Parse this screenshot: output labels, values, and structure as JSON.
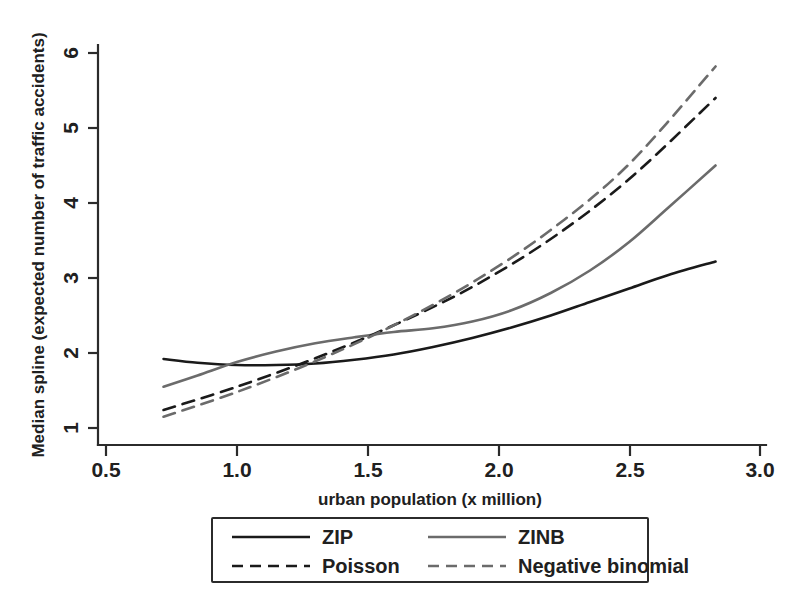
{
  "chart_data": {
    "type": "line",
    "title": "",
    "xlabel": "urban population (x million)",
    "ylabel": "Median spline (expected number of traffic accidents)",
    "xlim": [
      0.36,
      3.06
    ],
    "ylim": [
      0.75,
      6.1
    ],
    "xticks": [
      0.5,
      1.0,
      1.5,
      2.0,
      2.5,
      3.0
    ],
    "xtick_labels": [
      "0.5",
      "1.0",
      "1.5",
      "2.0",
      "2.5",
      "3.0"
    ],
    "yticks": [
      1,
      2,
      3,
      4,
      5,
      6
    ],
    "ytick_labels": [
      "1",
      "2",
      "3",
      "4",
      "5",
      "6"
    ],
    "grid": false,
    "legend_position": "below-center",
    "series": [
      {
        "name": "ZIP",
        "style": "solid",
        "color": "#1a1a1a",
        "x": [
          0.72,
          0.85,
          1.0,
          1.15,
          1.3,
          1.45,
          1.6,
          1.75,
          1.9,
          2.05,
          2.2,
          2.35,
          2.5,
          2.65,
          2.83
        ],
        "y": [
          1.92,
          1.87,
          1.84,
          1.84,
          1.86,
          1.91,
          1.98,
          2.08,
          2.2,
          2.34,
          2.5,
          2.68,
          2.86,
          3.04,
          3.22
        ]
      },
      {
        "name": "ZINB",
        "style": "solid",
        "color": "#6b6b6b",
        "x": [
          0.72,
          0.85,
          1.0,
          1.15,
          1.3,
          1.45,
          1.6,
          1.75,
          1.9,
          2.05,
          2.2,
          2.35,
          2.5,
          2.65,
          2.83
        ],
        "y": [
          1.55,
          1.7,
          1.88,
          2.02,
          2.13,
          2.21,
          2.28,
          2.33,
          2.42,
          2.57,
          2.8,
          3.1,
          3.48,
          3.94,
          4.5
        ]
      },
      {
        "name": "Poisson",
        "style": "dashed",
        "color": "#1a1a1a",
        "x": [
          0.72,
          1.0,
          1.3,
          1.6,
          1.9,
          2.2,
          2.5,
          2.83
        ],
        "y": [
          1.24,
          1.55,
          1.93,
          2.37,
          2.88,
          3.52,
          4.32,
          5.4
        ]
      },
      {
        "name": "Negative binomial",
        "style": "dashed",
        "color": "#6b6b6b",
        "x": [
          0.72,
          1.0,
          1.3,
          1.6,
          1.9,
          2.2,
          2.5,
          2.83
        ],
        "y": [
          1.15,
          1.48,
          1.89,
          2.37,
          2.94,
          3.64,
          4.52,
          5.82
        ]
      }
    ]
  },
  "axes": {
    "x_title": "urban population (x million)",
    "y_title": "Median spline (expected number of traffic accidents)",
    "x_tick_labels": [
      "0.5",
      "1.0",
      "1.5",
      "2.0",
      "2.5",
      "3.0"
    ],
    "y_tick_labels": [
      "1",
      "2",
      "3",
      "4",
      "5",
      "6"
    ]
  },
  "legend": {
    "entries": [
      {
        "label": "ZIP",
        "style": "solid",
        "color": "#1a1a1a"
      },
      {
        "label": "ZINB",
        "style": "solid",
        "color": "#6b6b6b"
      },
      {
        "label": "Poisson",
        "style": "dashed",
        "color": "#1a1a1a"
      },
      {
        "label": "Negative binomial",
        "style": "dashed",
        "color": "#6b6b6b"
      }
    ]
  },
  "colors": {
    "background": "#ffffff",
    "axis": "#2b2b2b",
    "dark_series": "#1a1a1a",
    "gray_series": "#6b6b6b"
  }
}
